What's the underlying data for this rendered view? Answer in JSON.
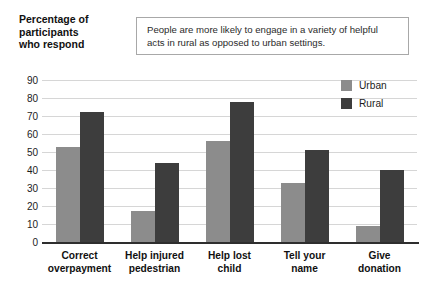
{
  "axis_title": "Percentage of\nparticipants\nwho respond",
  "caption": {
    "text": "People are more likely to engage in a variety of helpful acts in rural as opposed to urban settings."
  },
  "legend": {
    "position": "top-right",
    "items": [
      {
        "label": "Urban",
        "color": "#8c8c8c"
      },
      {
        "label": "Rural",
        "color": "#3d3d3d"
      }
    ]
  },
  "chart_data": {
    "type": "bar",
    "xlabel": "",
    "ylabel": "Percentage of participants who respond",
    "ylim": [
      0,
      90
    ],
    "ytick_step": 10,
    "yticks": [
      90,
      80,
      70,
      60,
      50,
      40,
      30,
      20,
      10,
      0
    ],
    "grid": true,
    "legend_position": "top-right",
    "categories": [
      "Correct overpayment",
      "Help injured pedestrian",
      "Help lost child",
      "Tell your name",
      "Give donation"
    ],
    "category_lines": [
      [
        "Correct",
        "overpayment"
      ],
      [
        "Help injured",
        "pedestrian"
      ],
      [
        "Help lost",
        "child"
      ],
      [
        "Tell your",
        "name"
      ],
      [
        "Give",
        "donation"
      ]
    ],
    "series": [
      {
        "name": "Urban",
        "color": "#8c8c8c",
        "values": [
          53,
          17,
          56,
          33,
          9
        ]
      },
      {
        "name": "Rural",
        "color": "#3d3d3d",
        "values": [
          72,
          44,
          78,
          51,
          40
        ]
      }
    ],
    "annotation": "People are more likely to engage in a variety of helpful acts in rural as opposed to urban settings."
  }
}
